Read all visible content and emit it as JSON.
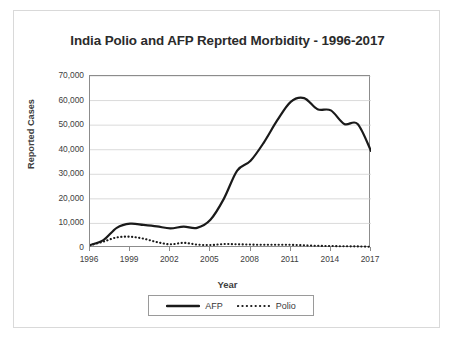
{
  "chart_data": {
    "type": "line",
    "title": "India Polio and AFP Reprted Morbidity - 1996-2017",
    "xlabel": "Year",
    "ylabel": "Reported Cases",
    "xlim": [
      1996,
      2017
    ],
    "ylim": [
      0,
      70000
    ],
    "grid": true,
    "legend_position": "bottom",
    "x": [
      1996,
      1997,
      1998,
      1999,
      2000,
      2001,
      2002,
      2003,
      2004,
      2005,
      2006,
      2007,
      2008,
      2009,
      2010,
      2011,
      2012,
      2013,
      2014,
      2015,
      2016,
      2017
    ],
    "xticks": [
      1996,
      1999,
      2002,
      2005,
      2008,
      2011,
      2014,
      2017
    ],
    "xtick_labels": [
      "1996",
      "1999",
      "2002",
      "2005",
      "2008",
      "2011",
      "2014",
      "2017"
    ],
    "yticks": [
      0,
      10000,
      20000,
      30000,
      40000,
      50000,
      60000,
      70000
    ],
    "ytick_labels": [
      "0",
      "10,000",
      "20,000",
      "30,000",
      "40,000",
      "50,000",
      "60,000",
      "70,000"
    ],
    "series": [
      {
        "name": "AFP",
        "style": "solid",
        "color": "#1a1a1a",
        "values": [
          1200,
          3200,
          8200,
          9900,
          9400,
          8800,
          8000,
          8700,
          8200,
          11500,
          20000,
          31500,
          35500,
          43000,
          52000,
          59500,
          61000,
          56500,
          56000,
          50500,
          50500,
          39500
        ]
      },
      {
        "name": "Polio",
        "style": "dotted",
        "color": "#1a1a1a",
        "values": [
          1100,
          2600,
          4300,
          4600,
          3800,
          2400,
          1500,
          2100,
          1400,
          1200,
          1600,
          1500,
          1400,
          1300,
          1350,
          1300,
          1100,
          900,
          800,
          700,
          650,
          500
        ]
      }
    ]
  },
  "legend": {
    "items": [
      {
        "label": "AFP",
        "style": "solid"
      },
      {
        "label": "Polio",
        "style": "dotted"
      }
    ]
  }
}
